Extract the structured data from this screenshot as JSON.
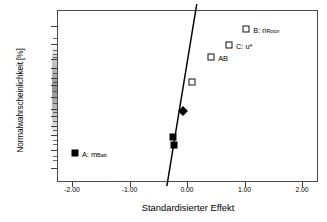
{
  "chart_data": {
    "type": "scatter",
    "title": "",
    "subtitle": "",
    "xlabel": "Standardisierter Effekt",
    "ylabel": "Normalwahrscheinlichkeit [%]",
    "xlim": [
      -2.4,
      2.3
    ],
    "ylim_percent": [
      0.05,
      99.95
    ],
    "x_ticks": [
      "-2.00",
      "-1.00",
      "0.00",
      "1.00",
      "2.00"
    ],
    "x_tick_values": [
      -2.0,
      -1.0,
      0.0,
      1.0,
      2.0
    ],
    "y_ticks": [
      "99.9",
      "99.0",
      "95.0",
      "90.0",
      "80.0",
      "70.0",
      "50.0",
      "30.0",
      "20.0",
      "10.0",
      "5.0",
      "1.0",
      "0.1"
    ],
    "y_tick_values": [
      99.9,
      99.0,
      95.0,
      90.0,
      80.0,
      70.0,
      50.0,
      30.0,
      20.0,
      10.0,
      5.0,
      1.0,
      0.1
    ],
    "grid": false,
    "legend": "none",
    "reference_line": {
      "label": "normal-reference-line",
      "x_at_bottom": -0.35,
      "x_at_top": 0.17,
      "color": "#000000"
    },
    "points": [
      {
        "id": "A",
        "label": "A: m",
        "label_sub": "Batt",
        "x": -1.95,
        "probability": 0.7,
        "marker": "filled-square",
        "label_side": "right"
      },
      {
        "id": "p2",
        "label": "",
        "label_sub": "",
        "x": -0.25,
        "probability": 4.2,
        "marker": "filled-square",
        "label_side": "none"
      },
      {
        "id": "p3",
        "label": "",
        "label_sub": "",
        "x": -0.22,
        "probability": 1.8,
        "marker": "filled-square",
        "label_side": "none"
      },
      {
        "id": "p4",
        "label": "",
        "label_sub": "",
        "x": -0.07,
        "probability": 27.0,
        "marker": "filled-diamond",
        "label_side": "none"
      },
      {
        "id": "p5",
        "label": "",
        "label_sub": "",
        "x": 0.08,
        "probability": 75.0,
        "marker": "open-square",
        "label_side": "none"
      },
      {
        "id": "AB",
        "label": "AB",
        "label_sub": "",
        "x": 0.42,
        "probability": 96.0,
        "marker": "open-square",
        "label_side": "right"
      },
      {
        "id": "C",
        "label": "C: u*",
        "label_sub": "",
        "x": 0.73,
        "probability": 98.8,
        "marker": "open-square",
        "label_side": "right"
      },
      {
        "id": "B",
        "label": "B: n",
        "label_sub": "Rotor",
        "x": 1.03,
        "probability": 99.85,
        "marker": "open-square",
        "label_side": "right"
      }
    ],
    "colors": {
      "axis": "#4a4a4a",
      "line": "#000000",
      "filled_marker": "#000000",
      "open_marker_fill": "#ffffff",
      "open_marker_border": "#111111",
      "background": "#ffffff"
    }
  }
}
